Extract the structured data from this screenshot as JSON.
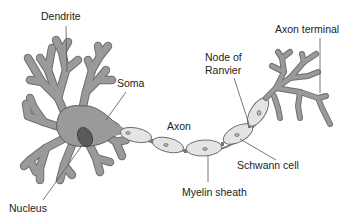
{
  "diagram": {
    "labels": {
      "dendrite": "Dendrite",
      "soma": "Soma",
      "axon": "Axon",
      "node_of_ranvier_line1": "Node of",
      "node_of_ranvier_line2": "Ranvier",
      "axon_terminal": "Axon terminal",
      "schwann_cell": "Schwann cell",
      "myelin_sheath": "Myelin sheath",
      "nucleus": "Nucleus"
    },
    "colors": {
      "background": "#ffffff",
      "cell_body_fill": "#9a9a9a",
      "cell_outline": "#555555",
      "myelin_fill": "#e4e4e4",
      "nucleus_fill": "#5a5a5a",
      "text": "#222222",
      "leader_line": "#555555"
    }
  }
}
